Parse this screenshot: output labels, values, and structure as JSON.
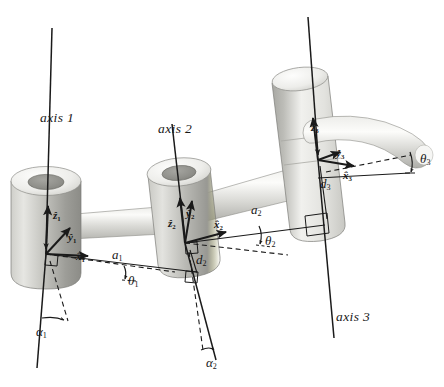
{
  "figure": {
    "type": "diagram",
    "background_color": "#ffffff",
    "line_color": "#1a1a1a",
    "link_fill_light": "#f2f2f0",
    "link_fill_mid": "#d8d8d4",
    "link_fill_dark": "#9a9a96",
    "bore_fill": "#8f8f8b",
    "width": 444,
    "height": 387
  },
  "axes": [
    {
      "id": "axis1",
      "label": "axis 1",
      "label_x": 40,
      "label_y": 111
    },
    {
      "id": "axis2",
      "label": "axis 2",
      "label_x": 158,
      "label_y": 122
    },
    {
      "id": "axis3",
      "label": "axis 3",
      "label_x": 336,
      "label_y": 310
    }
  ],
  "frames": [
    {
      "id": "frame1",
      "origin_x": 46,
      "origin_y": 254,
      "z": {
        "label": "ẑ",
        "sub": "1",
        "x": 53,
        "y": 210
      },
      "y": {
        "label": "ŷ",
        "sub": "1",
        "x": 68,
        "y": 232
      },
      "x": {
        "label": "x̂",
        "sub": "1",
        "x": 76,
        "y": 251
      }
    },
    {
      "id": "frame2",
      "origin_x": 185,
      "origin_y": 243,
      "z": {
        "label": "ẑ",
        "sub": "2",
        "x": 168,
        "y": 218
      },
      "y": {
        "label": "ŷ",
        "sub": "2",
        "x": 186,
        "y": 208
      },
      "x": {
        "label": "x̂",
        "sub": "2",
        "x": 214,
        "y": 219
      }
    },
    {
      "id": "frame3",
      "origin_x": 318,
      "origin_y": 160,
      "z": {
        "label": "ẑ",
        "sub": "3",
        "x": 311,
        "y": 122
      },
      "y": {
        "label": "ŷ",
        "sub": "3",
        "x": 336,
        "y": 148
      },
      "x": {
        "label": "x̂",
        "sub": "3",
        "x": 343,
        "y": 170
      }
    }
  ],
  "link_lengths": [
    {
      "id": "a1",
      "label": "a",
      "sub": "1",
      "x": 112,
      "y": 256
    },
    {
      "id": "a2",
      "label": "a",
      "sub": "2",
      "x": 251,
      "y": 208
    },
    {
      "id": "d2",
      "label": "d",
      "sub": "2",
      "x": 196,
      "y": 259
    },
    {
      "id": "d3",
      "label": "d",
      "sub": "3",
      "x": 320,
      "y": 183
    }
  ],
  "joint_angles": [
    {
      "id": "theta1",
      "label": "θ",
      "sub": "1",
      "x": 128,
      "y": 280
    },
    {
      "id": "theta2",
      "label": "θ",
      "sub": "2",
      "x": 265,
      "y": 240
    },
    {
      "id": "theta3",
      "label": "θ",
      "sub": "3",
      "x": 420,
      "y": 158
    }
  ],
  "twist_angles": [
    {
      "id": "alpha1",
      "label": "α",
      "sub": "1",
      "x": 36,
      "y": 333
    },
    {
      "id": "alpha2",
      "label": "α",
      "sub": "2",
      "x": 206,
      "y": 364
    }
  ]
}
